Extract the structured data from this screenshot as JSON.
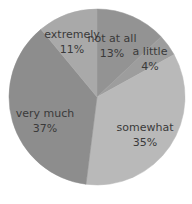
{
  "chart_data": {
    "type": "pie",
    "title": "",
    "start_angle_deg": 0,
    "direction": "clockwise",
    "center": [
      97,
      97
    ],
    "radius": 88,
    "slices": [
      {
        "label": "not at all",
        "value": 13,
        "display": "13%",
        "color": "#939393",
        "label_pos": [
          112,
          42
        ]
      },
      {
        "label": "a little",
        "value": 4,
        "display": "4%",
        "color": "#9d9d9d",
        "label_pos": [
          150,
          55
        ]
      },
      {
        "label": "somewhat",
        "value": 35,
        "display": "35%",
        "color": "#b9b9b9",
        "label_pos": [
          145,
          131
        ]
      },
      {
        "label": "very much",
        "value": 37,
        "display": "37%",
        "color": "#8d8d8d",
        "label_pos": [
          45,
          117
        ]
      },
      {
        "label": "extremely",
        "value": 11,
        "display": "11%",
        "color": "#a9a9a9",
        "label_pos": [
          72,
          38
        ]
      }
    ],
    "legend": null,
    "grid": false
  }
}
